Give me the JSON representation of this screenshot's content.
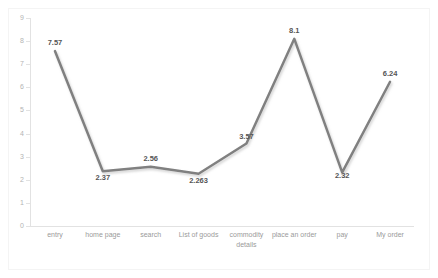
{
  "chart_data": {
    "type": "line",
    "title": "",
    "subtitle": "",
    "xlabel": "",
    "ylabel": "",
    "categories": [
      "entry",
      "home page",
      "search",
      "List of goods",
      "commodity details",
      "place an order",
      "pay",
      "My order"
    ],
    "values": [
      7.57,
      2.37,
      2.56,
      2.263,
      3.57,
      8.1,
      2.32,
      6.24
    ],
    "point_labels": [
      "7.57",
      "2.37",
      "2.56",
      "2.263",
      "3.57",
      "8.1",
      "2.32",
      "6.24"
    ],
    "ylim": [
      0,
      9
    ],
    "y_ticks": [
      9,
      8,
      7,
      6,
      5,
      4,
      3,
      2,
      1,
      0
    ],
    "y_tick_labels": [
      "9",
      "8",
      "7",
      "6",
      "5",
      "4",
      "3",
      "2",
      "1",
      "0"
    ],
    "grid": false,
    "legend": "none",
    "series": [
      {
        "name": "",
        "values": [
          7.57,
          2.37,
          2.56,
          2.263,
          3.57,
          8.1,
          2.32,
          6.24
        ]
      }
    ],
    "colors": {
      "line": "#808080",
      "line_shadow": "#d9d9d9",
      "axis": "#e2e2e2",
      "tick_label": "#b4b4b4",
      "category_label": "#9a9a9a",
      "data_label": "#555555",
      "background": "#ffffff",
      "border": "#f4f4f4"
    },
    "line_width": 2.5,
    "data_labels_shown": true
  }
}
